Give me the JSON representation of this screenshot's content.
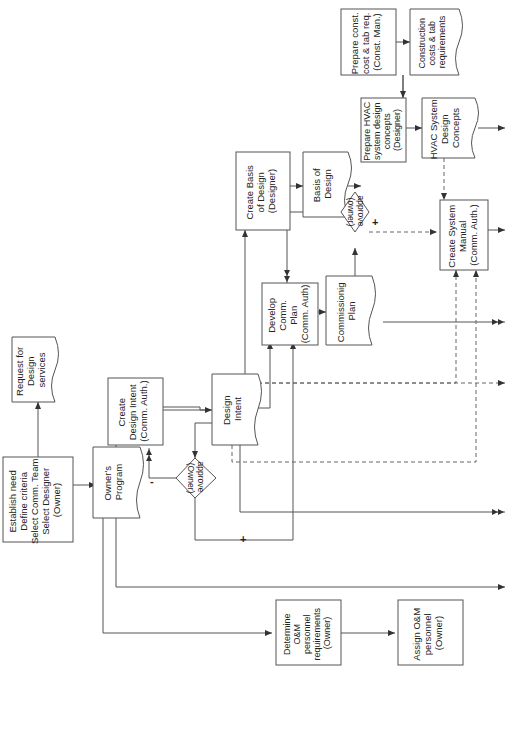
{
  "diagram": {
    "orientation": "rotated-90-ccw",
    "nodes": {
      "establish_need": {
        "shape": "process",
        "lines": [
          "Establish need",
          "Define criteria",
          "Select Comm. Team",
          "Select Designer",
          "(Owner)"
        ]
      },
      "request_design": {
        "shape": "document",
        "lines": [
          "Request for",
          "Design",
          "services"
        ]
      },
      "owners_program": {
        "shape": "document",
        "lines": [
          "Owner's",
          "Program"
        ]
      },
      "create_design_intent": {
        "shape": "process",
        "lines": [
          "Create",
          "Design Intent",
          "(Comm. Auth.)"
        ]
      },
      "approve_owner_1": {
        "shape": "decision",
        "lines": [
          "approve",
          "(Owner)"
        ]
      },
      "design_intent": {
        "shape": "document",
        "lines": [
          "Design",
          "Intent"
        ]
      },
      "create_basis": {
        "shape": "process",
        "lines": [
          "Create Basis",
          "of Design",
          "(Designer)"
        ]
      },
      "develop_comm_plan": {
        "shape": "process",
        "lines": [
          "Develop",
          "Comm.",
          "Plan",
          "(Comm. Auth)"
        ]
      },
      "basis_of_design": {
        "shape": "document",
        "lines": [
          "Basis of",
          "Design"
        ]
      },
      "commissioning_plan": {
        "shape": "document",
        "lines": [
          "Commissionig",
          "Plan"
        ]
      },
      "approve_owner_2": {
        "shape": "decision",
        "lines": [
          "approve",
          "(owner)"
        ]
      },
      "prepare_const_cost": {
        "shape": "process",
        "lines": [
          "Prepare const.",
          "cost & tab req.",
          "(Const. Man.)"
        ]
      },
      "prepare_hvac": {
        "shape": "process",
        "lines": [
          "Prepare HVAC",
          "system design",
          "concepts",
          "(Designer)"
        ]
      },
      "construction_costs": {
        "shape": "document",
        "lines": [
          "Construction",
          "costs & tab",
          "requirements"
        ]
      },
      "hvac_concepts": {
        "shape": "document",
        "lines": [
          "HVAC System",
          "Design",
          "Concepts"
        ]
      },
      "create_system_manual": {
        "shape": "process",
        "lines": [
          "Create System",
          "Manual",
          "(Comm. Auth.)"
        ]
      },
      "determine_om": {
        "shape": "process",
        "lines": [
          "Determine",
          "O&M",
          "personnel",
          "requirements",
          "(Owner)"
        ]
      },
      "assign_om": {
        "shape": "process",
        "lines": [
          "Assign O&M",
          "personnel",
          "(Owner)"
        ]
      }
    },
    "signs": {
      "minus": "-",
      "plus": "+"
    }
  }
}
